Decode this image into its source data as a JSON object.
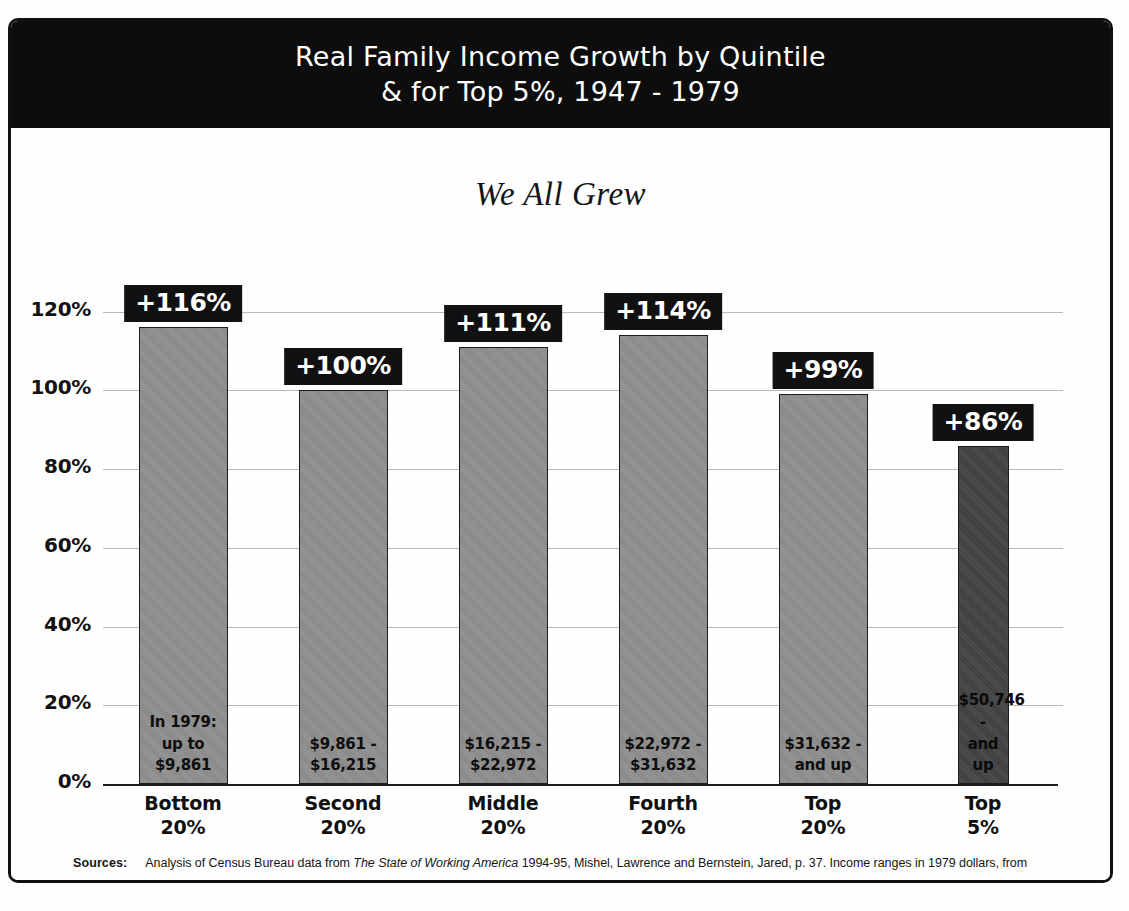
{
  "poster": {
    "title_line1": "Real Family Income Growth by Quintile",
    "title_line2": "& for Top 5%, 1947 - 1979",
    "subtitle": "We All Grew",
    "source_label": "Sources:",
    "source_text_1": "Analysis of Census Bureau data from ",
    "source_italic": "The State of Working America",
    "source_text_2": " 1994-95, Mishel, Lawrence and Bernstein, Jared, p. 37. Income ranges in 1979 dollars, from"
  },
  "colors": {
    "banner_bg": "#0d0d0d",
    "chip_bg": "#111111",
    "bar_fill": "#878787",
    "bar_fill_dark": "#3c3c3c",
    "bar_border": "#1c1c1c",
    "gridline": "#b9b9b9",
    "axis": "#1d1d1d",
    "paper": "#fefefe"
  },
  "chart_data": {
    "type": "bar",
    "title": "Real Family Income Growth by Quintile & for Top 5%, 1947 - 1979",
    "subtitle": "We All Grew",
    "xlabel": "",
    "ylabel": "",
    "ylim": [
      0,
      125
    ],
    "grid": true,
    "legend": "none",
    "ytick_labels": [
      "0%",
      "20%",
      "40%",
      "60%",
      "80%",
      "100%",
      "120%"
    ],
    "ytick_values": [
      0,
      20,
      40,
      60,
      80,
      100,
      120
    ],
    "categories": [
      "Bottom\n20%",
      "Second\n20%",
      "Middle\n20%",
      "Fourth\n20%",
      "Top\n20%",
      "Top\n5%"
    ],
    "category_lines": [
      [
        "Bottom",
        "20%"
      ],
      [
        "Second",
        "20%"
      ],
      [
        "Middle",
        "20%"
      ],
      [
        "Fourth",
        "20%"
      ],
      [
        "Top",
        "20%"
      ],
      [
        "Top",
        "5%"
      ]
    ],
    "values": [
      116,
      100,
      111,
      114,
      99,
      86
    ],
    "value_labels": [
      "+116%",
      "+100%",
      "+111%",
      "+114%",
      "+99%",
      "+86%"
    ],
    "bar_notes": [
      [
        "In 1979:",
        "up to",
        "$9,861"
      ],
      [
        "$9,861 -",
        "$16,215"
      ],
      [
        "$16,215 -",
        "$22,972"
      ],
      [
        "$22,972 -",
        "$31,632"
      ],
      [
        "$31,632 -",
        "and up"
      ],
      [
        "$50,746 -",
        "and up"
      ]
    ],
    "highlight_index": 5
  }
}
